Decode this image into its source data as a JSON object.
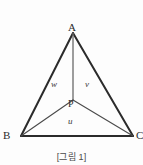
{
  "figure": {
    "caption": "[그림 1]",
    "vertices": {
      "apex": "A",
      "bottom_left": "B",
      "bottom_right": "C",
      "interior_point": "P"
    },
    "segment_labels": {
      "left_region": "w",
      "right_region": "v",
      "bottom_region": "u"
    },
    "colors": {
      "outer_edge": "#2b2b2b",
      "inner_edge": "#555555",
      "background": "#fdfdfd",
      "text": "#2b2b2b"
    },
    "geometry": {
      "A": [
        73,
        33
      ],
      "B": [
        21,
        136
      ],
      "C": [
        133,
        136
      ],
      "P": [
        73,
        100
      ]
    }
  }
}
